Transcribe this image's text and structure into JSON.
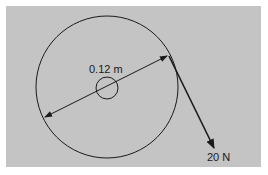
{
  "diagram": {
    "type": "pulley-force",
    "background_color": "#c4c4c4",
    "stroke_color": "#1a1a1a",
    "outer_circle": {
      "cx": 107,
      "cy": 87,
      "r": 71
    },
    "hub_circle": {
      "cx": 107,
      "cy": 88,
      "r": 11
    },
    "diameter_line": {
      "x1": 45,
      "y1": 117,
      "x2": 167,
      "y2": 56
    },
    "diameter_label": "0.12 m",
    "force_arrow": {
      "x1": 169,
      "y1": 56,
      "x2": 214,
      "y2": 148
    },
    "force_label": "20 N"
  }
}
